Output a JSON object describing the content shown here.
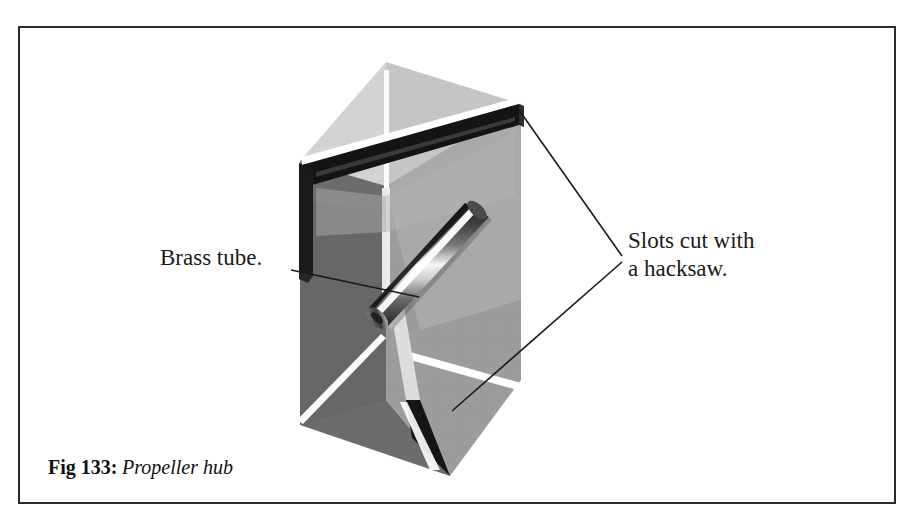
{
  "figure": {
    "caption_label": "Fig 133:",
    "caption_description": "Propeller hub",
    "frame_color": "#2b2b2b",
    "background_color": "#ffffff"
  },
  "annotations": [
    {
      "id": "brass-tube",
      "text": "Brass tube.",
      "text_x": 160,
      "text_y": 265,
      "leader_from_x": 291,
      "leader_from_y": 270,
      "leader_to_x": 419,
      "leader_to_y": 297
    },
    {
      "id": "slots-hacksaw",
      "line1": "Slots cut with",
      "line2": "a hacksaw.",
      "text_x": 628,
      "text_y": 248,
      "text_y2": 276,
      "junction_x": 622,
      "junction_y": 256,
      "upper_target_x": 519,
      "upper_target_y": 110,
      "lower_target_x": 452,
      "lower_target_y": 411
    }
  ],
  "object": {
    "name": "propeller-hub-block",
    "description": "Triangular-prism wooden hub with two hacksaw slots and a brass tube",
    "apex_x": 386,
    "apex_y": 62,
    "bottom_vertex_x": 450,
    "bottom_vertex_y": 476,
    "colors": {
      "top_face_light": "#d2d2d2",
      "top_face_mid": "#bfbfbf",
      "left_face_dark": "#6a6a6a",
      "right_face_mid": "#9b9b9b",
      "right_face_light": "#a8a8a8",
      "slot_dark": "#1c1c1c",
      "slot_shadow": "#3a3a3a",
      "highlight_white": "#fdfdfd",
      "tube_body": "#6e6e6e",
      "tube_highlight": "#f2f2f2",
      "tube_dark": "#2a2a2a"
    }
  },
  "parts": {
    "upper_slot": "Slot cut with a hacksaw (upper)",
    "lower_slot": "Slot cut with a hacksaw (lower)",
    "brass_tube": "Brass tube through hub centre"
  }
}
